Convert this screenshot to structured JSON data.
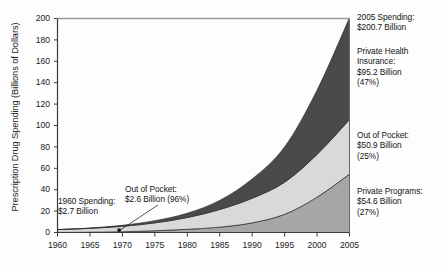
{
  "chart_data": {
    "type": "area",
    "stacked": true,
    "title": "",
    "xlabel": "",
    "ylabel": "Prescription Drug Spending (Billions of Dollars)",
    "x": [
      1960,
      1965,
      1970,
      1975,
      1980,
      1985,
      1990,
      1995,
      2000,
      2005
    ],
    "xlim": [
      1960,
      2005
    ],
    "ylim": [
      0,
      200
    ],
    "xticks": [
      "1960",
      "1965",
      "1970",
      "1975",
      "1980",
      "1985",
      "1990",
      "1995",
      "2000",
      "2005"
    ],
    "yticks": [
      "0",
      "20",
      "40",
      "60",
      "80",
      "100",
      "120",
      "140",
      "160",
      "180",
      "200"
    ],
    "grid": false,
    "legend_position": "none",
    "series": [
      {
        "name": "Private Programs",
        "color": "#a6a6a6",
        "values": [
          0.1,
          0.3,
          0.7,
          1.6,
          3.0,
          5.0,
          9.0,
          17.0,
          33.0,
          54.6
        ]
      },
      {
        "name": "Out of Pocket",
        "color": "#d9d9d9",
        "values": [
          2.6,
          3.6,
          5.1,
          7.4,
          11.0,
          16.5,
          23.0,
          30.0,
          40.0,
          50.9
        ]
      },
      {
        "name": "Private Health Insurance",
        "color": "#4a4a4a",
        "values": [
          0.0,
          0.3,
          0.9,
          2.0,
          4.0,
          8.5,
          18.0,
          33.0,
          60.0,
          95.2
        ]
      }
    ],
    "totals": [
      2.7,
      4.2,
      6.7,
      11.0,
      18.0,
      30.0,
      50.0,
      80.0,
      133.0,
      200.7
    ],
    "annotations": [
      {
        "name": "spending-1960",
        "text": "1960 Spending:\n$2.7 Billion"
      },
      {
        "name": "out-of-pocket-1960",
        "text": "Out of Pocket:\n$2.6 Billion (96%)"
      },
      {
        "name": "spending-2005",
        "text": "2005 Spending:\n$200.7 Billion"
      },
      {
        "name": "private-health-insurance-2005",
        "text": "Private Health\nInsurance:\n$95.2 Billion\n(47%)"
      },
      {
        "name": "out-of-pocket-2005",
        "text": "Out of Pocket:\n$50.9 Billion\n(25%)"
      },
      {
        "name": "private-programs-2005",
        "text": "Private Programs:\n$54.6 Billion\n(27%)"
      }
    ]
  },
  "axis": {
    "y_title": "Prescription Drug Spending (Billions of Dollars)"
  }
}
